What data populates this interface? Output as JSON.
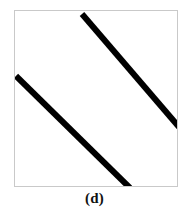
{
  "figure": {
    "caption": "(d)",
    "panel_label": "d",
    "background_color": "#ffffff",
    "frame_color": "#c9c9c9",
    "line_color": "#000000",
    "frame": {
      "x": 14,
      "y": 10,
      "width": 164,
      "height": 177
    }
  },
  "chart_data": {
    "type": "line",
    "title": "(d)",
    "subtitle": "",
    "xlabel": "",
    "ylabel": "",
    "xlim": [
      0,
      164
    ],
    "ylim": [
      0,
      177
    ],
    "grid": false,
    "legend": "none",
    "tick_labels": {
      "x": [],
      "y": []
    },
    "annotations": [],
    "series": [
      {
        "name": "upper-segment",
        "color": "#000000",
        "stroke_width": 6,
        "x": [
          67,
          164
        ],
        "y": [
          3,
          116
        ]
      },
      {
        "name": "lower-segment",
        "color": "#000000",
        "stroke_width": 6,
        "x": [
          1,
          115
        ],
        "y": [
          65,
          177
        ]
      }
    ]
  }
}
